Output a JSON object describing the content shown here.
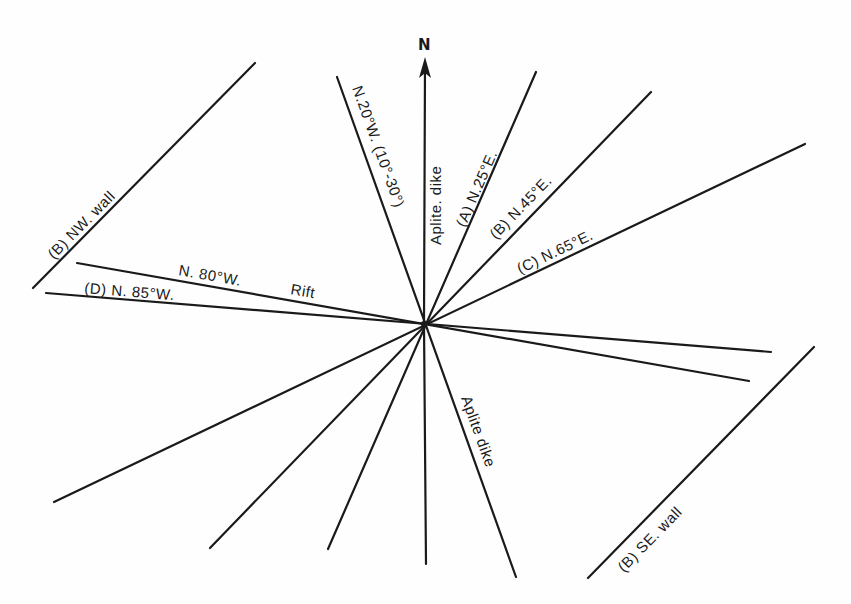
{
  "diagram": {
    "north_label": "N",
    "center": [
      424,
      324
    ],
    "labels": {
      "n20w": "N.20°W. (10°-30°)",
      "aplite_n": "Aplite. dike",
      "n25e": "(A) N.25°E.",
      "n45e": "(B) N.45°E.",
      "n65e": "(C) N.65°E.",
      "nw_wall": "(B)   NW. wall",
      "n80w": "N. 80°W.",
      "rift": "Rift",
      "n85w": "(D)    N. 85°W.",
      "aplite_s": "Aplite dike",
      "se_wall": "(B)     SE. wall"
    },
    "lines": [
      {
        "name": "north-arrow-line",
        "from": [
          424,
          324
        ],
        "to": [
          425,
          60
        ]
      },
      {
        "name": "n20w-line",
        "from": [
          337,
          77
        ],
        "to": [
          516,
          577
        ]
      },
      {
        "name": "n25e-line",
        "from": [
          536,
          72
        ],
        "to": [
          328,
          549
        ]
      },
      {
        "name": "n45e-line",
        "from": [
          651,
          92
        ],
        "to": [
          210,
          548
        ]
      },
      {
        "name": "n65e-line",
        "from": [
          805,
          144
        ],
        "to": [
          54,
          502
        ]
      },
      {
        "name": "n80w-line",
        "from": [
          77,
          263
        ],
        "to": [
          749,
          381
        ]
      },
      {
        "name": "n85w-line",
        "from": [
          46,
          293
        ],
        "to": [
          771,
          352
        ]
      },
      {
        "name": "north-south-lower-line",
        "from": [
          424,
          324
        ],
        "to": [
          426,
          564
        ]
      },
      {
        "name": "nw-wall-line",
        "from": [
          255,
          63
        ],
        "to": [
          33,
          288
        ]
      },
      {
        "name": "se-wall-line",
        "from": [
          814,
          347
        ],
        "to": [
          588,
          578
        ]
      }
    ]
  }
}
